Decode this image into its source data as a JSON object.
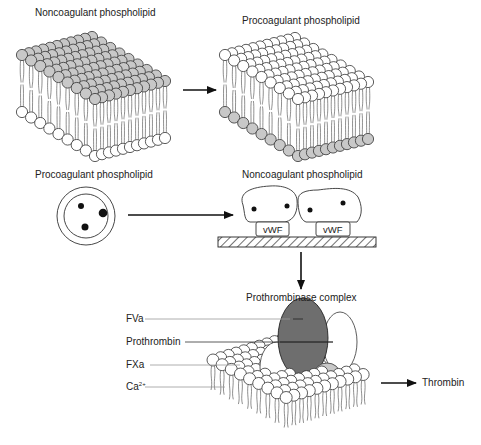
{
  "panel_top": {
    "left_label": "Noncoagulant phospholipid",
    "right_label": "Procoagulant phospholipid",
    "left_outer_color": "#c8c8c8",
    "right_inner_color": "#c8c8c8"
  },
  "panel_middle": {
    "left_label": "Procoagulant phospholipid",
    "right_label": "Noncoagulant phospholipid",
    "vwf_labels": [
      "vWF",
      "vWF"
    ]
  },
  "panel_bottom": {
    "title": "Prothrombinase complex",
    "components": [
      {
        "label": "FVa"
      },
      {
        "label": "Prothrombin"
      },
      {
        "label": "FXa"
      },
      {
        "label": "Ca",
        "sup": "2+"
      }
    ],
    "product": "Thrombin",
    "colors": {
      "prothrombin": "#6e6e6e",
      "ca": "#c8c8c8"
    }
  }
}
